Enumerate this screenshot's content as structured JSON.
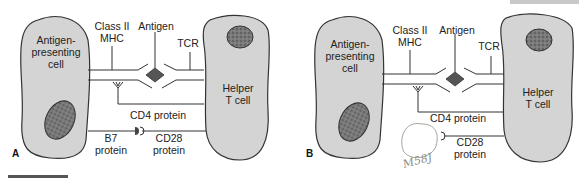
{
  "figure": {
    "panels": [
      {
        "id": "A",
        "panel_label": "A",
        "apc_label": [
          "Antigen-",
          "presenting",
          "cell"
        ],
        "helper_label": [
          "Helper",
          "T cell"
        ],
        "mhc_label": [
          "Class II",
          "MHC"
        ],
        "antigen_label": "Antigen",
        "tcr_label": "TCR",
        "cd4_label": "CD4 protein",
        "b7_label": [
          "B7",
          "protein"
        ],
        "cd28_label": [
          "CD28",
          "protein"
        ]
      },
      {
        "id": "B",
        "panel_label": "B",
        "apc_label": [
          "Antigen-",
          "presenting",
          "cell"
        ],
        "helper_label": [
          "Helper",
          "T cell"
        ],
        "mhc_label": [
          "Class II",
          "MHC"
        ],
        "antigen_label": "Antigen",
        "tcr_label": "TCR",
        "cd4_label": "CD4 protein",
        "cd28_label": [
          "CD28",
          "protein"
        ],
        "handwriting": "M58J"
      }
    ],
    "colors": {
      "cell_fill": "#d4d4d4",
      "outline": "#3a3a3a",
      "nucleus": "#6e6e6e",
      "antigen": "#5a5a5a"
    }
  }
}
